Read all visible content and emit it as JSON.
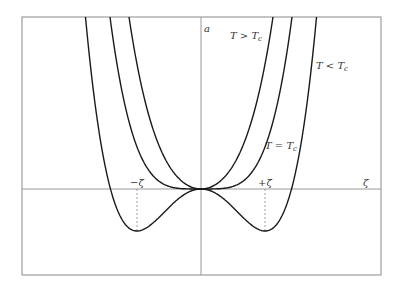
{
  "figure": {
    "axes": {
      "y_label": "a",
      "x_label": "ζ"
    },
    "curve_labels": {
      "above": "T > T",
      "above_sub": "c",
      "below": "T < T",
      "below_sub": "c",
      "critical": "T = T",
      "critical_sub": "c"
    },
    "markers": {
      "minus": "−ζ̄",
      "plus": "+ζ̄"
    }
  },
  "chart_data": {
    "type": "line",
    "title": "",
    "xlabel": "ζ",
    "ylabel": "a",
    "frame_px": {
      "left": 22,
      "top": 17,
      "right": 381,
      "bottom": 275
    },
    "origin_px": {
      "x": 201,
      "y": 189
    },
    "grid": false,
    "series": [
      {
        "name": "T > T_c",
        "form": "a = p2*u^2 + p4*u^4",
        "p2": 0.02022,
        "p4": 2.5e-06
      },
      {
        "name": "T = T_c",
        "form": "a = p2*u^2 + p4*u^4",
        "p2": 0.0,
        "p4": 2.508e-06
      },
      {
        "name": "T < T_c",
        "form": "a = p2*u^2 + p4*u^4",
        "p2": -0.02051,
        "p4": 2.503e-06
      }
    ],
    "minima": {
      "zeta_px": 64,
      "depth_px": 42
    },
    "annotations": [
      "−ζ̄",
      "+ζ̄",
      "T > T_c",
      "T < T_c",
      "T = T_c"
    ]
  },
  "colors": {
    "frame": "#8a8a8a",
    "axis": "#9a9a9a",
    "curve": "#1a1a1a",
    "dashed": "#888888",
    "text": "#333333"
  }
}
